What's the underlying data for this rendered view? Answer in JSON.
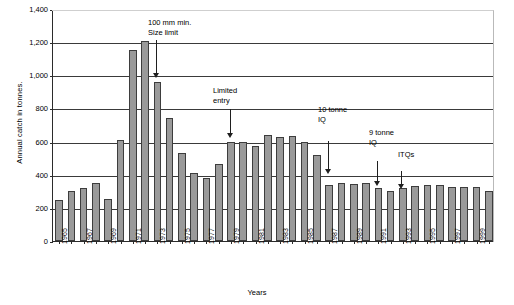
{
  "chart_data": {
    "type": "bar",
    "title": "",
    "xlabel": "Years",
    "ylabel": "Annual catch in tonnes.",
    "ylim": [
      0,
      1400
    ],
    "ytick_values": [
      0,
      200,
      400,
      600,
      800,
      1000,
      1200,
      1400
    ],
    "ytick_labels": [
      "0",
      "200",
      "400",
      "600",
      "800",
      "1,000",
      "1,200",
      "1,400"
    ],
    "grid": true,
    "legend": "none",
    "bar_color": "#9a9a9a",
    "bar_border_color": "#3d3d3d",
    "axis_color": "#2b2b2b",
    "categories": [
      "1965",
      "1966",
      "1967",
      "1968",
      "1969",
      "1970",
      "1971",
      "1972",
      "1973",
      "1974",
      "1975",
      "1976",
      "1977",
      "1978",
      "1979",
      "1980",
      "1981",
      "1982",
      "1983",
      "1984",
      "1985",
      "1986",
      "1987",
      "1988",
      "1989",
      "1990",
      "1991",
      "1992",
      "1993",
      "1994",
      "1995",
      "1996",
      "1997",
      "1998",
      "1999",
      "2000"
    ],
    "xtick_labels": [
      "1965",
      "",
      "1967",
      "",
      "1969",
      "",
      "1971",
      "",
      "1973",
      "",
      "1975",
      "",
      "1977",
      "",
      "1979",
      "",
      "1981",
      "",
      "1983",
      "",
      "1985",
      "",
      "1987",
      "",
      "1989",
      "",
      "1991",
      "",
      "1993",
      "",
      "1995",
      "",
      "1997",
      "",
      "1999",
      ""
    ],
    "values": [
      250,
      300,
      320,
      348,
      252,
      608,
      1150,
      1205,
      960,
      745,
      530,
      412,
      378,
      462,
      598,
      598,
      572,
      640,
      628,
      632,
      598,
      518,
      340,
      352,
      345,
      348,
      318,
      300,
      318,
      330,
      338,
      340,
      328,
      325,
      328,
      302
    ]
  },
  "annotations": [
    {
      "id": "size-limit",
      "lines": [
        "100 mm min.",
        "Size limit"
      ],
      "target_year": "1973"
    },
    {
      "id": "limited-entry",
      "lines": [
        "Limited",
        "entry"
      ],
      "target_year": "1979"
    },
    {
      "id": "iq-10",
      "lines": [
        "10 tonne",
        "IQ"
      ],
      "target_year": "1987"
    },
    {
      "id": "iq-9",
      "lines": [
        "9 tonne",
        "IQ"
      ],
      "target_year": "1991"
    },
    {
      "id": "itqs",
      "lines": [
        "ITQs"
      ],
      "target_year": "1993"
    }
  ]
}
